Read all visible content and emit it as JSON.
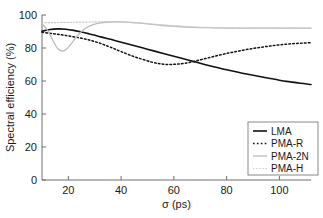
{
  "chart_data": {
    "type": "line",
    "title": "",
    "xlabel": "σ (ps)",
    "ylabel": "Spectral efficiency (%)",
    "xlim": [
      10,
      112
    ],
    "ylim": [
      0,
      100
    ],
    "xticks": [
      20,
      40,
      60,
      80,
      100
    ],
    "yticks": [
      0,
      20,
      40,
      60,
      80,
      100
    ],
    "xtick_labels": [
      "20",
      "40",
      "60",
      "80",
      "100"
    ],
    "ytick_labels": [
      "0",
      "20",
      "40",
      "60",
      "80",
      "100"
    ],
    "grid": false,
    "legend_position": "lower-right",
    "series": [
      {
        "name": "LMA",
        "style": "solid",
        "color": "#111111",
        "width": 1.6,
        "x": [
          10,
          13,
          16,
          19,
          22,
          25,
          28,
          31,
          34,
          37,
          40,
          44,
          48,
          52,
          56,
          60,
          64,
          68,
          72,
          76,
          80,
          84,
          88,
          92,
          96,
          100,
          104,
          108,
          112
        ],
        "y": [
          90.2,
          91.2,
          91.6,
          91.4,
          90.7,
          89.7,
          88.5,
          87.3,
          86.0,
          84.8,
          83.5,
          81.8,
          80.1,
          78.4,
          76.7,
          75.0,
          73.3,
          71.6,
          69.9,
          68.3,
          66.8,
          65.4,
          64.1,
          62.9,
          61.7,
          60.5,
          59.5,
          58.6,
          57.9
        ]
      },
      {
        "name": "PMA-R",
        "style": "dotted",
        "color": "#111111",
        "width": 1.5,
        "x": [
          10,
          13,
          16,
          19,
          22,
          25,
          28,
          31,
          34,
          37,
          40,
          44,
          48,
          52,
          55,
          58,
          61,
          64,
          68,
          72,
          76,
          80,
          84,
          88,
          92,
          96,
          100,
          104,
          108,
          112
        ],
        "y": [
          89.5,
          88.9,
          88.3,
          87.6,
          86.8,
          85.9,
          84.8,
          83.4,
          81.7,
          79.8,
          77.8,
          75.3,
          73.2,
          71.3,
          70.4,
          70.0,
          70.2,
          70.7,
          72.0,
          73.6,
          75.2,
          76.7,
          78.0,
          79.2,
          80.2,
          81.1,
          81.9,
          82.5,
          82.9,
          83.2
        ]
      },
      {
        "name": "PMA-2N",
        "style": "solid",
        "color": "#bcbcbc",
        "width": 1.3,
        "x": [
          10,
          12,
          14,
          16,
          18,
          20,
          22,
          24,
          26,
          28,
          31,
          34,
          38,
          42,
          46,
          50,
          55,
          60,
          65,
          70,
          75,
          80,
          85,
          90,
          95,
          100,
          105,
          112
        ],
        "y": [
          94.8,
          91.0,
          85.0,
          79.6,
          78.2,
          80.5,
          84.5,
          88.3,
          91.3,
          93.3,
          94.9,
          95.6,
          95.9,
          95.7,
          95.2,
          94.6,
          93.8,
          93.2,
          92.7,
          92.4,
          92.2,
          92.1,
          92.0,
          92.0,
          92.0,
          92.0,
          92.0,
          92.0
        ]
      },
      {
        "name": "PMA-H",
        "style": "dotted",
        "color": "#c9c9c9",
        "width": 1.2,
        "x": [
          10,
          14,
          18,
          22,
          26,
          30,
          34,
          38,
          42,
          46,
          50,
          55,
          60,
          65,
          70,
          75,
          80,
          85,
          90,
          95,
          100,
          105,
          112
        ],
        "y": [
          95.3,
          95.4,
          95.5,
          95.6,
          95.7,
          95.8,
          95.9,
          95.9,
          95.7,
          95.3,
          94.8,
          94.1,
          93.5,
          93.0,
          92.6,
          92.4,
          92.2,
          92.1,
          92.1,
          92.0,
          92.0,
          92.0,
          92.0
        ]
      }
    ]
  },
  "legend": {
    "entries": [
      {
        "label": "LMA"
      },
      {
        "label": "PMA-R"
      },
      {
        "label": "PMA-2N"
      },
      {
        "label": "PMA-H"
      }
    ]
  }
}
